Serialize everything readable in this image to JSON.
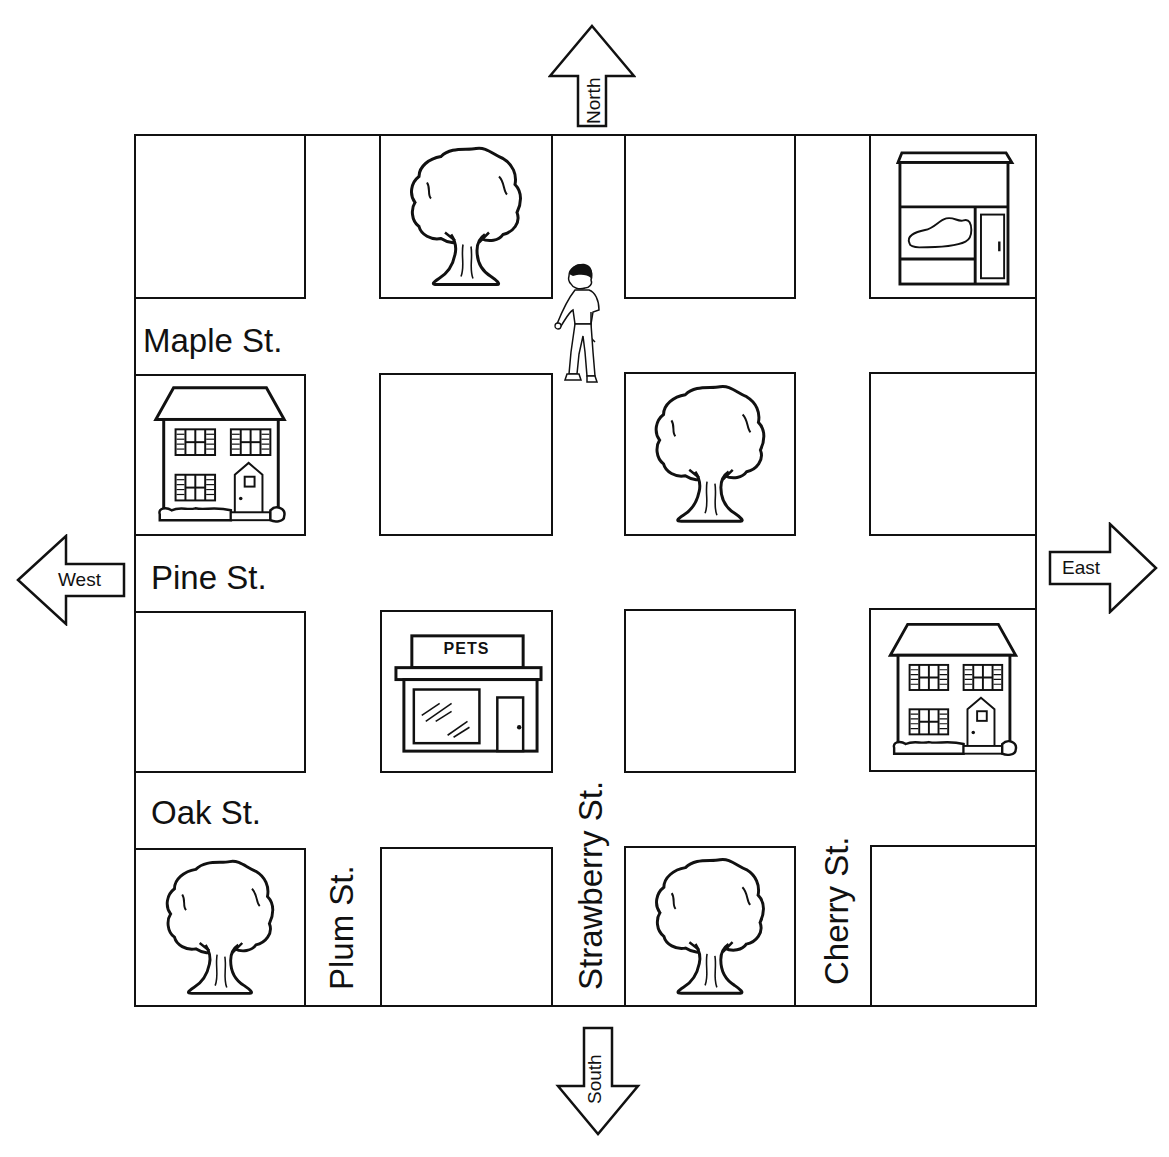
{
  "map": {
    "compass": {
      "north": "North",
      "south": "South",
      "east": "East",
      "west": "West"
    },
    "streets": {
      "horizontal": [
        "Maple St.",
        "Pine St.",
        "Oak St."
      ],
      "vertical": [
        "Plum St.",
        "Strawberry St.",
        "Cherry St."
      ]
    },
    "blocks": [
      {
        "row": 1,
        "col": 1,
        "content": "empty"
      },
      {
        "row": 1,
        "col": 2,
        "content": "tree"
      },
      {
        "row": 1,
        "col": 3,
        "content": "empty"
      },
      {
        "row": 1,
        "col": 4,
        "content": "shoe-store"
      },
      {
        "row": 2,
        "col": 1,
        "content": "house"
      },
      {
        "row": 2,
        "col": 2,
        "content": "empty"
      },
      {
        "row": 2,
        "col": 3,
        "content": "tree"
      },
      {
        "row": 2,
        "col": 4,
        "content": "empty"
      },
      {
        "row": 3,
        "col": 1,
        "content": "empty"
      },
      {
        "row": 3,
        "col": 2,
        "content": "pet-store"
      },
      {
        "row": 3,
        "col": 3,
        "content": "empty"
      },
      {
        "row": 3,
        "col": 4,
        "content": "house"
      },
      {
        "row": 4,
        "col": 1,
        "content": "tree"
      },
      {
        "row": 4,
        "col": 2,
        "content": "empty"
      },
      {
        "row": 4,
        "col": 3,
        "content": "tree"
      },
      {
        "row": 4,
        "col": 4,
        "content": "empty"
      }
    ],
    "pet_store_sign": "PETS",
    "person": {
      "location": "Strawberry St. between Maple St. and top row, walking"
    }
  }
}
